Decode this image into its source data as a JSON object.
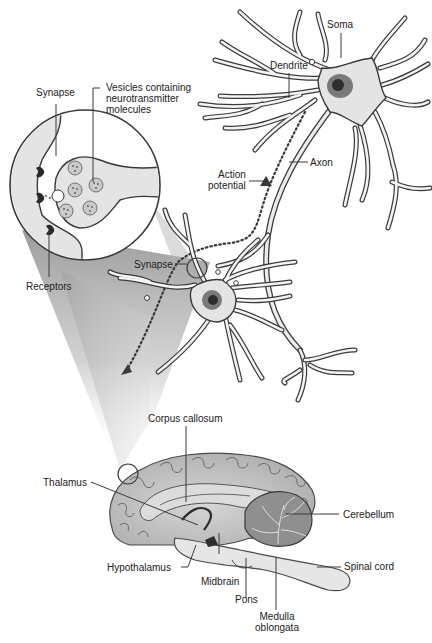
{
  "diagram": {
    "colors": {
      "outline": "#3a3a3a",
      "cell_fill": "#e4e4e4",
      "nucleus_outer": "#7a7a7a",
      "nucleus_inner": "#2e2e2e",
      "brain_fill": "#bdbdbd",
      "brain_inner": "#dcdcdc",
      "cerebellum_fill": "#8f8f8f",
      "beam_shade": "#9a9a9a",
      "vesicle_fill": "#c9c9c9",
      "receptor": "#2a2a2a"
    },
    "neuron_labels": {
      "soma": "Soma",
      "dendrite": "Dendrite",
      "axon": "Axon",
      "action_potential_line1": "Action",
      "action_potential_line2": "potential",
      "synapse_small": "Synapse"
    },
    "synapse_inset_labels": {
      "synapse": "Synapse",
      "vesicles_line1": "Vesicles containing",
      "vesicles_line2": "neurotransmitter",
      "vesicles_line3": "molecules",
      "receptors": "Receptors"
    },
    "brain_labels": {
      "corpus_callosum": "Corpus callosum",
      "thalamus": "Thalamus",
      "hypothalamus": "Hypothalamus",
      "midbrain": "Midbrain",
      "pons": "Pons",
      "medulla_line1": "Medulla",
      "medulla_line2": "oblongata",
      "cerebellum": "Cerebellum",
      "spinal_cord": "Spinal cord"
    }
  }
}
